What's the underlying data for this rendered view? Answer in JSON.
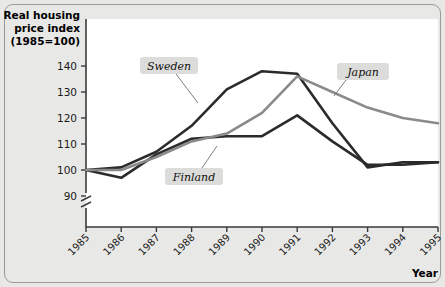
{
  "chart_data": {
    "type": "line",
    "title": "",
    "ylabel": "Real housing price index (1985=100)",
    "ylabel_lines": [
      "Real housing",
      "price index",
      "(1985=100)"
    ],
    "xlabel": "Year",
    "categories": [
      "1985",
      "1986",
      "1987",
      "1988",
      "1989",
      "1990",
      "1991",
      "1992",
      "1993",
      "1994",
      "1995"
    ],
    "ylim": [
      88,
      143
    ],
    "yticks": [
      90,
      100,
      110,
      120,
      130,
      140
    ],
    "ytick_labels": [
      "90",
      "100",
      "110",
      "120",
      "130",
      "140"
    ],
    "axis_break": true,
    "grid": false,
    "legend_position": "inline-annotations",
    "series": [
      {
        "name": "Sweden",
        "color": "#2b2b2b",
        "width": 2.6,
        "values": [
          100,
          101,
          107,
          117,
          131,
          138,
          137,
          118,
          101,
          103,
          103
        ]
      },
      {
        "name": "Finland",
        "color": "#2b2b2b",
        "width": 2.6,
        "values": [
          100,
          97,
          106,
          112,
          113,
          113,
          121,
          111,
          102,
          102,
          103
        ]
      },
      {
        "name": "Japan",
        "color": "#8a8a88",
        "width": 2.6,
        "values": [
          100,
          100,
          105,
          111,
          114,
          122,
          136,
          130,
          124,
          120,
          118
        ]
      }
    ],
    "annotations": [
      {
        "label": "Sweden",
        "box_x": 140,
        "box_y": 57,
        "box_w": 58,
        "box_h": 17,
        "lead_x1": 176,
        "lead_y1": 74,
        "lead_x2": 198,
        "lead_y2": 103
      },
      {
        "label": "Finland",
        "box_x": 165,
        "box_y": 168,
        "box_w": 58,
        "box_h": 17,
        "lead_x1": 202,
        "lead_y1": 168,
        "lead_x2": 217,
        "lead_y2": 146
      },
      {
        "label": "Japan",
        "box_x": 337,
        "box_y": 63,
        "box_w": 52,
        "box_h": 17,
        "lead_x1": 346,
        "lead_y1": 80,
        "lead_x2": 334,
        "lead_y2": 96
      }
    ]
  },
  "axis": {
    "y_title_l1": "Real housing",
    "y_title_l2": "price index",
    "y_title_l3": "(1985=100)",
    "x_title": "Year"
  },
  "colors": {
    "page_background": "#e8e8e6",
    "plot_background": "#ffffff",
    "frame_border": "#9a9a98",
    "axis": "#3a3a3a",
    "dark_series": "#2b2b2b",
    "gray_series": "#8a8a88",
    "annotation_box": "#dcdcda"
  }
}
